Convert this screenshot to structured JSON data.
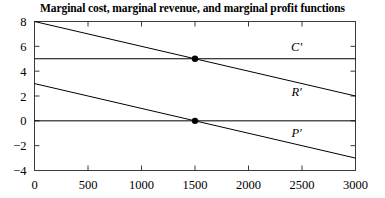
{
  "chart_data": {
    "type": "line",
    "title": "Marginal cost, marginal revenue, and marginal profit functions",
    "xlabel": "",
    "ylabel": "",
    "xlim": [
      0,
      3000
    ],
    "ylim": [
      -4,
      8
    ],
    "xticks": [
      0,
      500,
      1000,
      1500,
      2000,
      2500,
      3000
    ],
    "xticklabels": [
      "0",
      "500",
      "1000",
      "1500",
      "2000",
      "2500",
      "3000"
    ],
    "yticks": [
      -4,
      -2,
      0,
      2,
      4,
      6,
      8
    ],
    "yticklabels": [
      "−4",
      "−2",
      "0",
      "2",
      "4",
      "6",
      "8"
    ],
    "grid": false,
    "legend_position": "inline-right",
    "series": [
      {
        "name": "C'",
        "label": "C′",
        "kind": "horizontal-line",
        "x": [
          0,
          3000
        ],
        "values": [
          5,
          5
        ],
        "color": "#000000",
        "label_x": 2450,
        "label_y": 6.0
      },
      {
        "name": "R'",
        "label": "R′",
        "kind": "line",
        "x": [
          0,
          3000
        ],
        "values": [
          8,
          2
        ],
        "color": "#000000",
        "label_x": 2450,
        "label_y": 2.35
      },
      {
        "name": "P'",
        "label": "P′",
        "kind": "line",
        "x": [
          0,
          3000
        ],
        "values": [
          3,
          -3
        ],
        "color": "#000000",
        "label_x": 2450,
        "label_y": -0.95
      },
      {
        "name": "zero-line",
        "label": "",
        "kind": "horizontal-line",
        "x": [
          0,
          3000
        ],
        "values": [
          0,
          0
        ],
        "color": "#000000",
        "label_x": null,
        "label_y": null
      }
    ],
    "markers": [
      {
        "name": "mc-equals-mr",
        "x": 1500,
        "y": 5
      },
      {
        "name": "mp-zero",
        "x": 1500,
        "y": 0
      }
    ],
    "annotations": []
  }
}
